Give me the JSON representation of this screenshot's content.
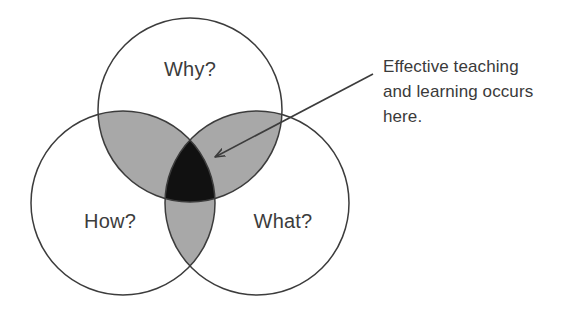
{
  "figure": {
    "type": "venn-diagram-3-set",
    "background_color": "#ffffff",
    "width": 575,
    "height": 315
  },
  "circles": [
    {
      "id": "why",
      "label": "Why?",
      "position": "top",
      "cx": 190,
      "cy": 110,
      "r": 92,
      "label_x": 190,
      "label_y": 76,
      "fill": "#ffffff",
      "stroke": "#3c3c3c"
    },
    {
      "id": "how",
      "label": "How?",
      "position": "bottom-left",
      "cx": 123,
      "cy": 203,
      "r": 92,
      "label_x": 110,
      "label_y": 228,
      "fill": "#ffffff",
      "stroke": "#3c3c3c"
    },
    {
      "id": "what",
      "label": "What?",
      "position": "bottom-right",
      "cx": 257,
      "cy": 203,
      "r": 92,
      "label_x": 283,
      "label_y": 228,
      "fill": "#ffffff",
      "stroke": "#3c3c3c"
    }
  ],
  "regions": {
    "pairwise_overlap_color": "#a8a8a8",
    "center_overlap_color": "#111111",
    "pairwise_overlaps": [
      {
        "id": "why-how",
        "sets": "Why? ∩ How?"
      },
      {
        "id": "why-what",
        "sets": "Why? ∩ What?"
      },
      {
        "id": "how-what",
        "sets": "How? ∩ What?"
      }
    ],
    "center_overlap": {
      "id": "why-how-what",
      "sets": "Why? ∩ How? ∩ What?"
    }
  },
  "callout": {
    "text_lines": [
      "Effective teaching",
      "and learning occurs",
      "here."
    ],
    "full_text": "Effective teaching and learning occurs here.",
    "text_color": "#3a3a3a",
    "text_x": 383,
    "line_y": [
      72,
      97,
      122
    ],
    "arrow": {
      "start_x": 373,
      "start_y": 74,
      "end_x": 215,
      "end_y": 157,
      "color": "#3c3c3c"
    }
  }
}
